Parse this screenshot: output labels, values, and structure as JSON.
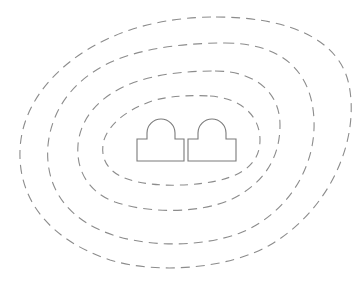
{
  "diagram": {
    "type": "contour-rings",
    "background": "#ffffff",
    "ring_color": "#8c8c8c",
    "shape_color": "#7a7a7a",
    "rings": [
      {
        "id": "ring-1",
        "d": "M 216 17 C 290 17 340 40 349 85 C 360 140 330 210 270 245 C 230 268 160 275 110 260 C 50 240 18 200 20 150 C 22 95 70 50 130 30 C 160 20 190 17 216 17 Z",
        "dash": "9 6"
      },
      {
        "id": "ring-2",
        "d": "M 225 43 C 280 43 312 70 314 120 C 316 170 285 215 240 233 C 200 248 140 248 100 230 C 60 212 45 180 48 145 C 52 105 80 70 130 55 C 160 46 195 43 225 43 Z",
        "dash": "9 6"
      },
      {
        "id": "ring-3",
        "d": "M 215 71 C 255 71 280 92 280 125 C 280 160 262 185 230 200 C 200 213 150 214 115 202 C 88 192 76 170 78 145 C 80 118 100 96 130 84 C 155 74 185 71 215 71 Z",
        "dash": "9 6"
      },
      {
        "id": "ring-4",
        "d": "M 210 96 C 240 98 260 115 260 140 C 260 165 240 178 205 183 C 175 187 140 186 120 176 C 105 168 100 155 104 140 C 110 122 130 108 155 100 C 172 96 190 95 210 96 Z",
        "dash": "8 6"
      }
    ],
    "shapes": [
      {
        "id": "left-arch-block",
        "d": "M 137 139 L 147 139 L 147 133 A 14 14 0 0 1 175 133 L 175 139 L 184 139 L 184 161 L 137 161 Z"
      },
      {
        "id": "right-arch-block",
        "d": "M 188 139 L 198 139 L 198 133 A 14 14 0 0 1 226 133 L 226 139 L 236 139 L 236 161 L 188 161 Z"
      }
    ]
  }
}
